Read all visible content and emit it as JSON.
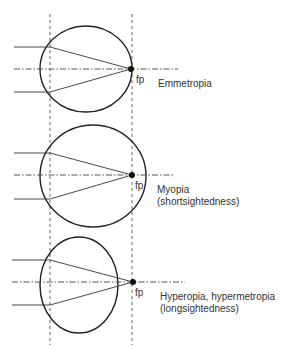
{
  "diagram": {
    "type": "refractive-errors-of-the-eye",
    "colors": {
      "line": "#333333",
      "background": "#ffffff"
    },
    "reference_lines": {
      "left_x": 50,
      "right_x": 132,
      "style": "dashed"
    },
    "panels": [
      {
        "id": "emmetropia",
        "condition": "Emmetropia",
        "subtitle": "",
        "focal_point_label": "fp",
        "eye": {
          "cx": 86,
          "cy": 69,
          "rx": 46,
          "ry": 43
        },
        "focus": {
          "x": 131,
          "y": 69
        }
      },
      {
        "id": "myopia",
        "condition": "Myopia",
        "subtitle": "(shortsightedness)",
        "focal_point_label": "fp",
        "eye": {
          "cx": 93,
          "cy": 176,
          "rx": 53,
          "ry": 51
        },
        "focus": {
          "x": 132,
          "y": 175
        }
      },
      {
        "id": "hyperopia",
        "condition": "Hyperopia, hypermetropia",
        "subtitle": "(longsightedness)",
        "focal_point_label": "fp",
        "eye": {
          "cx": 79,
          "cy": 285,
          "rx": 39,
          "ry": 48
        },
        "focus": {
          "x": 133,
          "y": 282
        }
      }
    ]
  }
}
